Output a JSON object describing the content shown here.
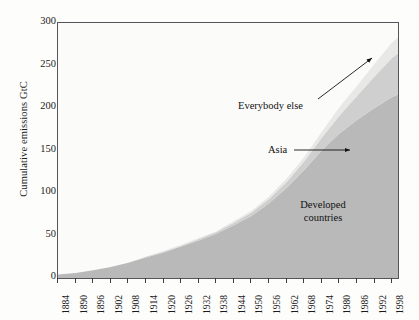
{
  "chart_data": {
    "type": "area",
    "title": "",
    "subtitle": "",
    "xlabel": "",
    "ylabel": "Cumulative emissions GtC",
    "stacked": true,
    "grid": false,
    "legend_position": "in-plot annotations",
    "xlim": [
      1884,
      2000
    ],
    "ylim": [
      0,
      300
    ],
    "yticks": [
      0,
      50,
      100,
      150,
      200,
      250,
      300
    ],
    "xticks": [
      1884,
      1890,
      1896,
      1902,
      1908,
      1914,
      1920,
      1926,
      1932,
      1938,
      1944,
      1950,
      1956,
      1962,
      1968,
      1974,
      1980,
      1986,
      1992,
      1998
    ],
    "x": [
      1884,
      1890,
      1896,
      1902,
      1908,
      1914,
      1920,
      1926,
      1932,
      1938,
      1944,
      1950,
      1956,
      1962,
      1968,
      1974,
      1980,
      1986,
      1992,
      1998,
      2000
    ],
    "series": [
      {
        "name": "Developed countries",
        "color": "#b9b9b9",
        "values": [
          4,
          6,
          9,
          13,
          18,
          24,
          30,
          37,
          44,
          52,
          62,
          73,
          88,
          106,
          127,
          150,
          170,
          186,
          200,
          213,
          216
        ]
      },
      {
        "name": "Asia",
        "color": "#cfcfcf",
        "values": [
          0,
          0,
          0,
          0,
          0,
          1,
          1,
          1,
          2,
          2,
          3,
          4,
          5,
          7,
          10,
          15,
          21,
          28,
          37,
          46,
          48
        ]
      },
      {
        "name": "Everybody else",
        "color": "#e8e8e6",
        "values": [
          0,
          0,
          0,
          0,
          0,
          0,
          1,
          1,
          1,
          1,
          2,
          2,
          3,
          4,
          5,
          7,
          10,
          12,
          15,
          18,
          19
        ]
      }
    ],
    "totals": [
      4,
      6,
      9,
      13,
      18,
      25,
      32,
      39,
      47,
      55,
      67,
      79,
      96,
      117,
      142,
      172,
      201,
      226,
      252,
      277,
      283
    ],
    "annotations": [
      {
        "text": "Everybody else",
        "target_series": "Everybody else"
      },
      {
        "text": "Asia",
        "target_series": "Asia"
      },
      {
        "text_line1": "Developed",
        "text_line2": "countries",
        "target_series": "Developed countries"
      }
    ]
  },
  "axis": {
    "ylabel": "Cumulative emissions GtC",
    "ytick_labels": [
      "300",
      "250",
      "200",
      "150",
      "100",
      "50",
      "0"
    ],
    "xtick_labels": [
      "1884",
      "1890",
      "1896",
      "1902",
      "1908",
      "1914",
      "1920",
      "1926",
      "1932",
      "1938",
      "1944",
      "1950",
      "1956",
      "1962",
      "1968",
      "1974",
      "1980",
      "1986",
      "1992",
      "1998"
    ]
  },
  "annotations": {
    "everybody_else": "Everybody else",
    "asia": "Asia",
    "developed_line1": "Developed",
    "developed_line2": "countries"
  },
  "colors": {
    "developed": "#b9b9b9",
    "asia": "#cfcfcf",
    "everybody_else": "#e8e8e6",
    "axis": "#55555a",
    "text": "#1a1a1a",
    "plot_background": "#fbfbf9"
  }
}
